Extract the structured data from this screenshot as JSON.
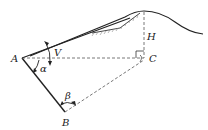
{
  "diagram": {
    "labels": {
      "A": "A",
      "B": "B",
      "C": "C",
      "H": "H",
      "V": "V",
      "alpha": "α",
      "beta": "β"
    },
    "colors": {
      "stroke": "#222222",
      "dashed": "#555555",
      "hatch": "#888888",
      "background": "#ffffff"
    }
  }
}
